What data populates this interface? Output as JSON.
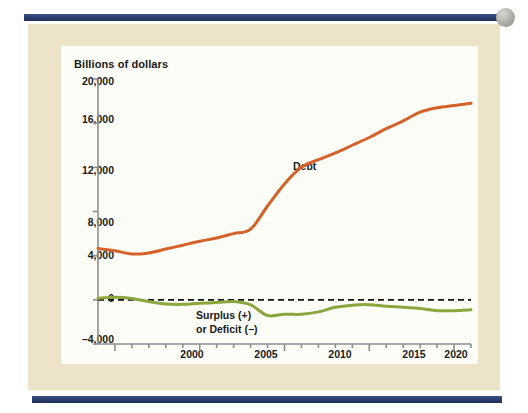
{
  "figure": {
    "panel_background": "#ece3c8",
    "plot_background": "#fdfdf8",
    "rule_color": "#2b3f6e"
  },
  "chart_data": {
    "type": "line",
    "title": "",
    "ylabel": "Billions of dollars",
    "xlabel": "",
    "ylim": [
      -4000,
      20000
    ],
    "yticks": [
      -4000,
      0,
      4000,
      8000,
      12000,
      16000,
      20000
    ],
    "ytick_labels": [
      "–4,000",
      "0",
      "4,000",
      "8,000",
      "12,000",
      "16,000",
      "20,000"
    ],
    "xlim": [
      1999,
      2021
    ],
    "xticks": [
      2000,
      2005,
      2010,
      2015,
      2020
    ],
    "xtick_labels": [
      "2000",
      "2005",
      "2010",
      "2015",
      "2020"
    ],
    "minor_xticks": [
      2001,
      2002,
      2003,
      2004,
      2006,
      2007,
      2008,
      2009,
      2011,
      2012,
      2013,
      2014,
      2016,
      2017,
      2018,
      2019,
      2021
    ],
    "grid": false,
    "legend_position": "inline-annotations",
    "zero_reference_line": {
      "value": 0,
      "style": "dashed",
      "color": "#111111"
    },
    "x": [
      1999,
      2000,
      2001,
      2002,
      2003,
      2004,
      2005,
      2006,
      2007,
      2008,
      2009,
      2010,
      2011,
      2012,
      2013,
      2014,
      2015,
      2016,
      2017,
      2018,
      2019,
      2020,
      2021
    ],
    "series": [
      {
        "name": "Debt",
        "color": "#d4622a",
        "annotation": "Debt",
        "values": [
          4650,
          4450,
          4150,
          4250,
          4600,
          4950,
          5300,
          5600,
          6000,
          6400,
          8500,
          10500,
          12000,
          12700,
          13300,
          14000,
          14700,
          15500,
          16200,
          17000,
          17400,
          17600,
          17800
        ]
      },
      {
        "name": "Surplus (+) or Deficit (−)",
        "color": "#8aa63c",
        "annotation_line1": "Surplus (+)",
        "annotation_line2": "or Deficit (−)",
        "values": [
          130,
          240,
          130,
          -160,
          -380,
          -410,
          -320,
          -250,
          -160,
          -460,
          -1420,
          -1300,
          -1310,
          -1090,
          -680,
          -480,
          -440,
          -590,
          -670,
          -780,
          -980,
          -980,
          -900
        ]
      }
    ]
  }
}
